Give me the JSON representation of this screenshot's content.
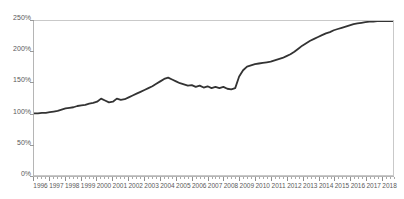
{
  "chart_data": {
    "type": "line",
    "title": "",
    "subtitle": "",
    "xlabel": "",
    "ylabel": "",
    "xlim": [
      1996,
      2018.75
    ],
    "ylim": [
      0,
      250
    ],
    "grid": false,
    "legend": null,
    "legend_position": "none",
    "y_ticks": [
      0,
      50,
      100,
      150,
      200,
      250
    ],
    "y_tick_labels": [
      "0%",
      "50%",
      "100%",
      "150%",
      "200%",
      "250%"
    ],
    "x_ticks": [
      1996,
      1997,
      1998,
      1999,
      2000,
      2001,
      2002,
      2003,
      2004,
      2005,
      2006,
      2007,
      2008,
      2009,
      2010,
      2011,
      2012,
      2013,
      2014,
      2015,
      2016,
      2017,
      2018
    ],
    "x_tick_labels": [
      "1996",
      "1997",
      "1998",
      "1999",
      "2000",
      "2001",
      "2002",
      "2003",
      "2004",
      "2005",
      "2006",
      "2007",
      "2008",
      "2009",
      "2010",
      "2011",
      "2012",
      "2013",
      "2014",
      "2015",
      "2016",
      "2017",
      "2018"
    ],
    "x_minor_tick_interval": 0.25,
    "series": [
      {
        "name": "series-1",
        "color": "#333333",
        "line_width": 1.8,
        "x": [
          1996.0,
          1996.25,
          1996.5,
          1996.75,
          1997.0,
          1997.25,
          1997.5,
          1997.75,
          1998.0,
          1998.25,
          1998.5,
          1998.75,
          1999.0,
          1999.25,
          1999.5,
          1999.75,
          2000.0,
          2000.25,
          2000.5,
          2000.75,
          2001.0,
          2001.25,
          2001.5,
          2001.75,
          2002.0,
          2002.25,
          2002.5,
          2002.75,
          2003.0,
          2003.25,
          2003.5,
          2003.75,
          2004.0,
          2004.25,
          2004.5,
          2004.75,
          2005.0,
          2005.25,
          2005.5,
          2005.75,
          2006.0,
          2006.25,
          2006.5,
          2006.75,
          2007.0,
          2007.25,
          2007.5,
          2007.75,
          2008.0,
          2008.25,
          2008.5,
          2008.75,
          2009.0,
          2009.25,
          2009.5,
          2009.75,
          2010.0,
          2010.25,
          2010.5,
          2010.75,
          2011.0,
          2011.25,
          2011.5,
          2011.75,
          2012.0,
          2012.25,
          2012.5,
          2012.75,
          2013.0,
          2013.25,
          2013.5,
          2013.75,
          2014.0,
          2014.25,
          2014.5,
          2014.75,
          2015.0,
          2015.25,
          2015.5,
          2015.75,
          2016.0,
          2016.25,
          2016.5,
          2016.75,
          2017.0,
          2017.25,
          2017.5,
          2017.75,
          2018.0,
          2018.25,
          2018.5,
          2018.75
        ],
        "y": [
          100,
          100,
          101,
          101,
          102,
          103,
          104,
          106,
          108,
          109,
          110,
          112,
          113,
          114,
          116,
          117,
          119,
          124,
          121,
          118,
          119,
          124,
          122,
          123,
          126,
          129,
          132,
          135,
          138,
          141,
          144,
          148,
          152,
          156,
          158,
          155,
          152,
          149,
          147,
          145,
          146,
          143,
          145,
          142,
          144,
          141,
          143,
          141,
          143,
          140,
          139,
          141,
          160,
          170,
          176,
          178,
          180,
          181,
          182,
          183,
          184,
          186,
          188,
          190,
          193,
          196,
          200,
          205,
          210,
          214,
          218,
          221,
          224,
          227,
          230,
          232,
          235,
          237,
          239,
          241,
          243,
          245,
          246,
          247,
          248,
          249,
          249,
          250,
          250,
          250,
          250,
          250
        ]
      }
    ]
  }
}
